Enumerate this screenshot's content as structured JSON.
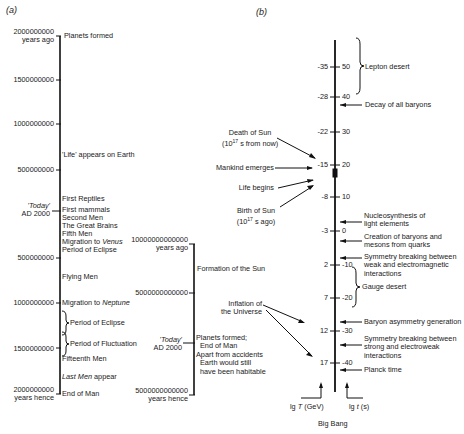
{
  "panel_a": {
    "label": "(a)",
    "timeline1": {
      "ticks": [
        {
          "value": "2000000000",
          "sub": "years ago"
        },
        {
          "value": "1500000000"
        },
        {
          "value": "1000000000"
        },
        {
          "value": "500000000"
        },
        {
          "value": "500000000"
        },
        {
          "value": "1000000000"
        },
        {
          "value": "1500000000"
        },
        {
          "value": "2000000000",
          "sub": "years hence"
        }
      ],
      "today": {
        "line1": "'Today'",
        "line2": "AD 2000"
      },
      "events": [
        "Planets formed",
        "'Life' appears on Earth",
        "First Reptiles",
        "First mammals",
        "Second Men",
        "The Great Brains",
        "Fifth Men",
        "Migration to",
        "Venus",
        "Period of Eclipse",
        "Flying Men",
        "Migration to",
        "Neptune",
        "Period of Eclipse",
        "Period of Fluctuation",
        "Fifteenth Men",
        "Last Men",
        "appear",
        "End of Man"
      ]
    },
    "timeline2": {
      "ticks": [
        {
          "value": "10000000000000",
          "sub": "years ago"
        },
        {
          "value": "5000000000000"
        },
        {
          "value": "5000000000000",
          "sub": "years hence"
        }
      ],
      "today": {
        "line1": "'Today'",
        "line2": "AD 2000"
      },
      "events": [
        "Formation of the Sun",
        "Planets formed;",
        "End of Man",
        "Apart from accidents",
        "Earth would still",
        "have been habitable"
      ]
    }
  },
  "panel_b": {
    "label": "(b)",
    "left_ticks": [
      "-35",
      "-28",
      "-22",
      "-15",
      "-8",
      "-3",
      "2",
      "7",
      "12",
      "17"
    ],
    "right_ticks": [
      "50",
      "40",
      "30",
      "20",
      "10",
      "0",
      "-10",
      "-20",
      "-30",
      "-40"
    ],
    "left_events": [
      {
        "line1": "Death of Sun",
        "line2": "(10",
        "sup": "17",
        "line2b": " s from now)"
      },
      {
        "line1": "Mankind emerges"
      },
      {
        "line1": "Life begins"
      },
      {
        "line1": "Birth of Sun",
        "line2": "(10",
        "sup": "17",
        "line2b": " s ago)"
      },
      {
        "line1": "Inflation of",
        "line2": "the Universe"
      }
    ],
    "right_events": [
      "Lepton desert",
      "Decay of all baryons",
      "Nucleosynthesis of",
      "light elements",
      "Creation of baryons and",
      "mesons from quarks",
      "Symmetry breaking between",
      "weak and electromagnetic",
      "interactions",
      "Gauge desert",
      "Baryon asymmetry generation",
      "Symmetry breaking between",
      "strong and electroweak",
      "interactions",
      "Planck time"
    ],
    "axis_left_label": {
      "pre": "lg ",
      "var": "T",
      "post": " (GeV)"
    },
    "axis_right_label": {
      "pre": "lg ",
      "var": "t",
      "post": " (s)"
    },
    "bottom_label": "Big Bang"
  }
}
